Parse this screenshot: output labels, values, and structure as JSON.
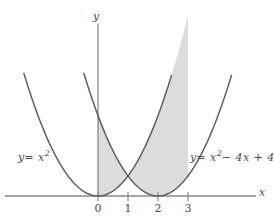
{
  "figure": {
    "type": "math-graph",
    "background": "#ffffff",
    "curve_color": "#5f5f5f",
    "axis_color": "#8a8a8a",
    "shade_color": "#dcdcdc",
    "text_color": "#4a4a4a"
  },
  "axes": {
    "x_label": "x",
    "y_label": "y",
    "x_ticks": [
      {
        "label": "0",
        "value": 0
      },
      {
        "label": "1",
        "value": 1
      },
      {
        "label": "2",
        "value": 2
      },
      {
        "label": "3",
        "value": 3
      }
    ],
    "y_ticks": []
  },
  "curves": {
    "left": {
      "label_y": "y",
      "label_eq": "= x",
      "label_exp": "2",
      "label_rest": "",
      "full_label": "y = x²",
      "equation": "y = x^2"
    },
    "right": {
      "label_y": "y",
      "label_eq": "= x",
      "label_exp": "2",
      "label_rest": "− 4x + 4",
      "full_label": "y = x² − 4x + 4",
      "equation": "y = x^2 - 4x + 4"
    }
  },
  "shaded_region": {
    "description": "region between the two parabolas",
    "x_start": 0,
    "x_end": 3,
    "crossing_x": 1
  },
  "chart_data": {
    "type": "line",
    "title": "",
    "xlabel": "x",
    "ylabel": "y",
    "xlim": [
      -3.1,
      5.2
    ],
    "ylim": [
      0,
      9.5
    ],
    "grid": false,
    "legend": "inline-labels",
    "series": [
      {
        "name": "y = x²",
        "expression": "x^2",
        "x": [
          -3.1,
          -2.5,
          -2,
          -1.5,
          -1,
          -0.5,
          0,
          0.5,
          1,
          1.5,
          2,
          2.5,
          3
        ],
        "values": [
          9.61,
          6.25,
          4,
          2.25,
          1,
          0.25,
          0,
          0.25,
          1,
          2.25,
          4,
          6.25,
          9
        ]
      },
      {
        "name": "y = x² − 4x + 4",
        "expression": "(x-2)^2",
        "x": [
          -1,
          -0.5,
          0,
          0.5,
          1,
          1.5,
          2,
          2.5,
          3,
          3.5,
          4,
          4.5,
          5
        ],
        "values": [
          9,
          6.25,
          4,
          2.25,
          1,
          0.25,
          0,
          0.25,
          1,
          2.25,
          4,
          6.25,
          9
        ]
      }
    ],
    "shaded": {
      "between": [
        "y = x²",
        "y = x² − 4x + 4"
      ],
      "from_x": 0,
      "to_x": 3,
      "intersection_x": 1
    },
    "annotations": [
      {
        "text": "y = x²",
        "x": -2.6,
        "y": 2.4
      },
      {
        "text": "y = x² − 4x + 4",
        "x": 3.1,
        "y": 2.4
      }
    ]
  }
}
